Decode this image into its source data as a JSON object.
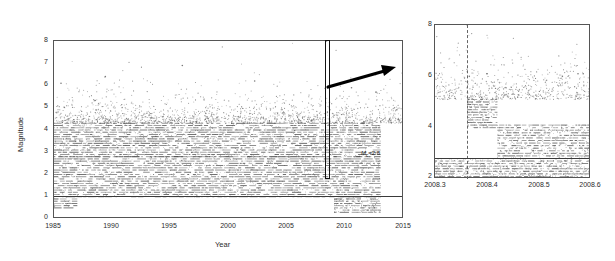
{
  "figure": {
    "title": "",
    "panels": [
      "left-catalog-panel",
      "right-zoom-panel"
    ]
  },
  "left_panel": {
    "name": "full-catalog-magnitude-time",
    "xlabel": "Year",
    "ylabel": "Magnitude",
    "xticks": [
      "1985",
      "1990",
      "1995",
      "2000",
      "2005",
      "2010",
      "2015"
    ],
    "yticks": [
      "0",
      "1",
      "2",
      "3",
      "4",
      "5",
      "6",
      "7",
      "8"
    ],
    "annotation_mc": "M",
    "annotation_mc_sub": "c",
    "annotation_mc_value": "=2.8",
    "annotation_full": "Mc=2.8"
  },
  "right_panel": {
    "name": "zoomed-2008-sequence",
    "xlabel": "",
    "ylabel": "",
    "xticks": [
      "2008.3",
      "2008.4",
      "2008.5",
      "2008.6"
    ],
    "yticks": [
      "2",
      "4",
      "6",
      "8"
    ]
  },
  "chart_data": {
    "type": "scatter",
    "panels": [
      {
        "id": "left",
        "type": "scatter",
        "title": "",
        "xlabel": "Year",
        "ylabel": "Magnitude",
        "xlim": [
          1985,
          2015
        ],
        "ylim": [
          0,
          8
        ],
        "xticks": [
          1985,
          1990,
          1995,
          2000,
          2005,
          2010,
          2015
        ],
        "yticks": [
          0,
          1,
          2,
          3,
          4,
          5,
          6,
          7,
          8
        ],
        "grid": false,
        "legend": "none",
        "annotations": [
          {
            "type": "hline",
            "label": "Mc=2.8",
            "y": 2.8,
            "note": "magnitude of completeness line spanning full width"
          },
          {
            "type": "rect",
            "label": "zoom-window",
            "x0": 2008.3,
            "x1": 2008.6,
            "y0": 2.0,
            "y1": 8.0,
            "note": "narrow vertical box marking the 2008 swarm expanded in right panel"
          },
          {
            "type": "arrow",
            "label": "zoom-pointer",
            "x0": 2008.6,
            "y0": 5.95,
            "x1": 2012.9,
            "y1": 6.45
          }
        ],
        "coverage_bands": [
          {
            "label": "M>=2.8 complete record",
            "x0": 1985,
            "x1": 2013,
            "ymin": 2.8,
            "ymax": 4.3
          },
          {
            "label": "M>=1.5 detection 1985-1987",
            "x0": 1985,
            "x1": 1987,
            "ymin": 0.5,
            "ymax": 2.8
          },
          {
            "label": "M>=1.0 detection 1987-2000",
            "x0": 1987,
            "x1": 2000,
            "ymin": 1.0,
            "ymax": 2.8
          },
          {
            "label": "M>=1.0 dense detection 2000-2013",
            "x0": 2000,
            "x1": 2013,
            "ymin": 1.0,
            "ymax": 2.8
          },
          {
            "label": "M>=0.3 dense detection 2009-2013",
            "x0": 2009,
            "x1": 2013,
            "ymin": 0.3,
            "ymax": 1.0
          }
        ],
        "largest_events": [
          {
            "x": 1989.4,
            "y": 6.4
          },
          {
            "x": 1996.0,
            "y": 6.9
          },
          {
            "x": 1985.6,
            "y": 6.1
          },
          {
            "x": 2002.2,
            "y": 6.2
          },
          {
            "x": 2008.36,
            "y": 8.0
          },
          {
            "x": 2010.5,
            "y": 5.9
          },
          {
            "x": 2012.6,
            "y": 5.7
          }
        ]
      },
      {
        "id": "right",
        "type": "scatter",
        "title": "",
        "xlabel": "",
        "ylabel": "",
        "xlim": [
          2008.3,
          2008.6
        ],
        "ylim": [
          2,
          8
        ],
        "xticks": [
          2008.3,
          2008.4,
          2008.5,
          2008.6
        ],
        "yticks": [
          2,
          4,
          6,
          8
        ],
        "grid": false,
        "legend": "none",
        "annotations": [
          {
            "type": "vline",
            "label": "mainshock-time",
            "x": 2008.362,
            "style": "dashed",
            "note": "mainshock M8 onset of aftershock sequence"
          },
          {
            "type": "hline",
            "label": "Mc=2.8",
            "y": 2.8
          }
        ],
        "coverage_bands": [
          {
            "label": "aftershocks M>=4 immediately post-mainshock",
            "x0": 2008.362,
            "x1": 2008.42,
            "ymin": 4.0,
            "ymax": 5.1
          },
          {
            "label": "decaying aftershock M>=3 band",
            "x0": 2008.42,
            "x1": 2008.6,
            "ymin": 2.8,
            "ymax": 4.1
          },
          {
            "label": "background M2-2.8 regional record",
            "x0": 2008.3,
            "x1": 2008.6,
            "ymin": 2.0,
            "ymax": 2.8
          }
        ],
        "largest_events": [
          {
            "x": 2008.362,
            "y": 8.0
          },
          {
            "x": 2008.366,
            "y": 6.0
          },
          {
            "x": 2008.4,
            "y": 6.1
          },
          {
            "x": 2008.545,
            "y": 6.0
          },
          {
            "x": 2008.575,
            "y": 6.1
          },
          {
            "x": 2008.585,
            "y": 6.1
          }
        ]
      }
    ]
  }
}
